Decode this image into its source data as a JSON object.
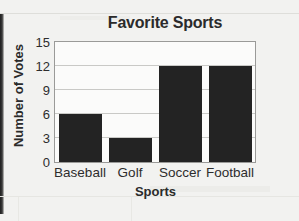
{
  "chart_data": {
    "type": "bar",
    "title": "Favorite Sports",
    "xlabel": "Sports",
    "ylabel": "Number of Votes",
    "categories": [
      "Baseball",
      "Golf",
      "Soccer",
      "Football"
    ],
    "values": [
      6,
      3,
      12,
      12
    ],
    "ylim": [
      0,
      15
    ],
    "yticks": [
      0,
      3,
      6,
      9,
      12,
      15
    ],
    "ytick_labels": [
      "0",
      "3",
      "6",
      "9",
      "12",
      "15"
    ],
    "grid": true,
    "legend": false,
    "bar_color": "#232323",
    "grid_color": "#c9c9c6",
    "axis_color": "#9a9a98",
    "text_color": "#2b2b2b",
    "background_color": "#f2f2f0",
    "plot_background_color": "#fbfbfa"
  }
}
